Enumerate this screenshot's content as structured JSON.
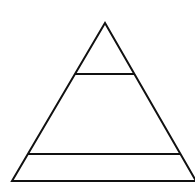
{
  "diagram": {
    "type": "pyramid",
    "levels": 3,
    "labels": [],
    "colors": {
      "stroke": "#111111",
      "fill": "#ffffff",
      "background": "#ffffff"
    },
    "geometry": {
      "apex": [
        105,
        23
      ],
      "base_left": [
        12,
        181
      ],
      "base_right": [
        196,
        181
      ],
      "dividers": [
        {
          "y": 74,
          "x1": 75,
          "x2": 135
        },
        {
          "y": 154,
          "x1": 28,
          "x2": 181
        }
      ],
      "stroke_width": 2
    }
  }
}
